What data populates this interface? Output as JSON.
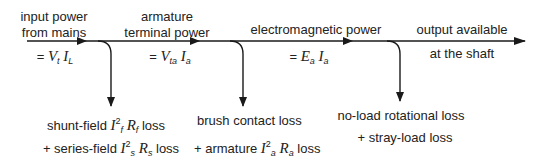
{
  "stages": [
    {
      "title_line1": "input power",
      "title_line2": "from mains",
      "formula": {
        "prefix": "= ",
        "v1": "V",
        "s1": "t",
        "v2": "I",
        "s2": "L"
      }
    },
    {
      "title_line1": "armature",
      "title_line2": "terminal power",
      "formula": {
        "prefix": "= ",
        "v1": "V",
        "s1": "ta",
        "v2": "I",
        "s2": "a"
      }
    },
    {
      "title_line1": "electromagnetic power",
      "formula": {
        "prefix": "= ",
        "v1": "E",
        "s1": "a",
        "v2": "I",
        "s2": "a"
      }
    },
    {
      "title_line1": "output available",
      "title_line2": "at the shaft"
    }
  ],
  "losses": [
    {
      "line1": {
        "text_a": "shunt-field ",
        "var1": "I",
        "sup": "2",
        "sub1": "f",
        "var2": "R",
        "sub2": "f",
        "text_b": " loss"
      },
      "line2": {
        "text_a": "+ series-field ",
        "var1": "I",
        "sup": "2",
        "sub1": "s",
        "var2": "R",
        "sub2": "s",
        "text_b": " loss"
      }
    },
    {
      "line1": {
        "text": "brush contact loss"
      },
      "line2": {
        "text_a": "+ armature ",
        "var1": "I",
        "sup": "2",
        "sub1": "a",
        "var2": "R",
        "sub2": "a",
        "text_b": " loss"
      }
    },
    {
      "line1": {
        "text": "no-load rotational loss"
      },
      "line2": {
        "text": "+ stray-load loss"
      }
    }
  ],
  "colors": {
    "line": "#1a1a1a",
    "text": "#222222",
    "background": "#ffffff"
  }
}
